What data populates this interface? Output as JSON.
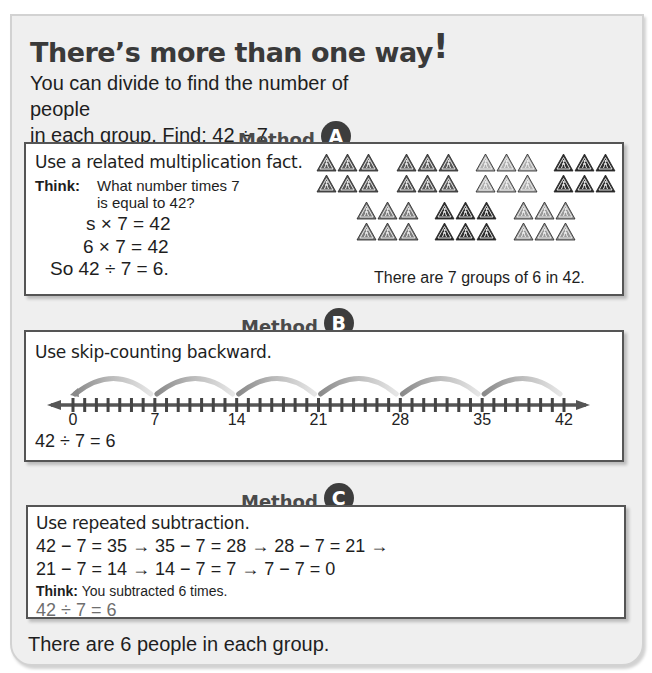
{
  "title": {
    "text": "There’s more than one way",
    "exclaim": "!"
  },
  "intro": {
    "line1": "You can divide to find the number of people",
    "line2": "in each group. Find: 42 ÷ 7"
  },
  "method_a": {
    "label": "Method",
    "letter": "A",
    "heading": "Use a related multiplication fact.",
    "think_label": "Think:",
    "think_line1": "What number times 7",
    "think_line2": "is equal to 42?",
    "eq1": "s × 7 = 42",
    "eq2": "6 × 7 = 42",
    "eq3": "So 42 ÷ 7 = 6.",
    "caption": "There are 7 groups of 6 in 42.",
    "groups": [
      {
        "color": "#5a5a5a"
      },
      {
        "color": "#5a5a5a"
      },
      {
        "color": "#b0b0b0"
      },
      {
        "color": "#2e2e2e"
      },
      {
        "color": "#7d7d7d"
      },
      {
        "color": "#2e2e2e"
      },
      {
        "color": "#9a9a9a"
      }
    ],
    "icon": "pedestrian-warning-sign-icon"
  },
  "method_b": {
    "label": "Method",
    "letter": "B",
    "heading": "Use skip-counting backward.",
    "number_line": {
      "min": 0,
      "max": 42,
      "step": 1,
      "labels": [
        "0",
        "7",
        "14",
        "21",
        "28",
        "35",
        "42"
      ],
      "jumps": 6
    },
    "result": "42 ÷ 7 = 6"
  },
  "method_c": {
    "label": "Method",
    "letter": "C",
    "heading": "Use repeated subtraction.",
    "line1": "42 − 7 = 35 → 35 − 7 = 28 → 28 − 7 = 21 →",
    "line2": "21 − 7 = 14 → 14 − 7 = 7 → 7 − 7 = 0",
    "think_label": "Think:",
    "think_text": "You subtracted 6 times.",
    "result": "42 ÷ 7 = 6"
  },
  "conclusion": "There are 6 people in each group."
}
